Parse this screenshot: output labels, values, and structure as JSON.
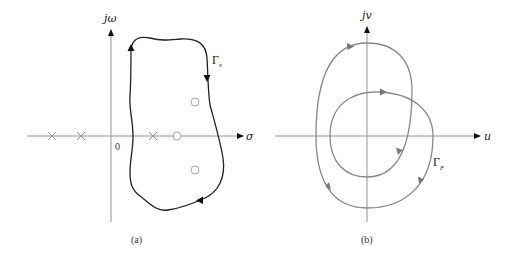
{
  "panels": [
    {
      "id": "a",
      "caption": "(a)",
      "plane": "s-plane",
      "axes": {
        "vertical_label": "jω",
        "horizontal_label": "σ",
        "origin_label": "0",
        "axis_color": "#888888"
      },
      "contour": {
        "label": "Γ",
        "label_subscript": "s",
        "direction": "clockwise",
        "color": "#222222"
      },
      "poles": [
        {
          "x": 52,
          "y": 136
        },
        {
          "x": 81,
          "y": 136
        },
        {
          "x": 153,
          "y": 136
        }
      ],
      "zeros": [
        {
          "x": 177,
          "y": 136
        },
        {
          "x": 195,
          "y": 102
        },
        {
          "x": 195,
          "y": 170
        }
      ],
      "marker_color": "#aaaaaa"
    },
    {
      "id": "b",
      "caption": "(b)",
      "plane": "F(s)-plane",
      "axes": {
        "vertical_label": "jv",
        "horizontal_label": "u",
        "axis_color": "#888888"
      },
      "contour": {
        "label": "Γ",
        "label_subscript": "F",
        "direction": "clockwise",
        "encirclements_of_origin": 2,
        "color": "#888888"
      }
    }
  ]
}
